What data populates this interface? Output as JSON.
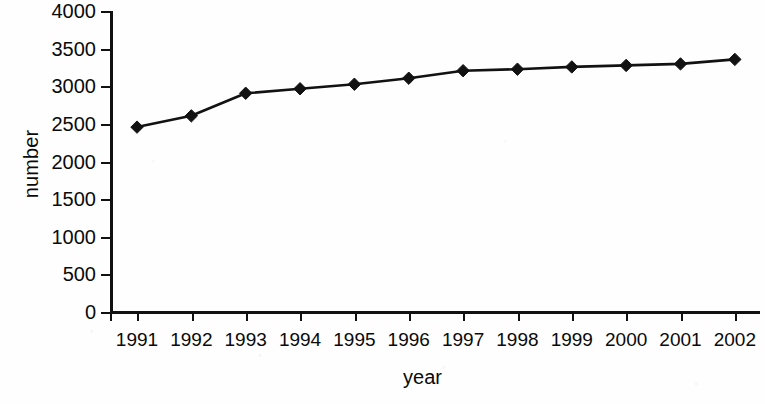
{
  "chart_data": {
    "type": "line",
    "title": "",
    "xlabel": "year",
    "ylabel": "number",
    "categories": [
      "1991",
      "1992",
      "1993",
      "1994",
      "1995",
      "1996",
      "1997",
      "1998",
      "1999",
      "2000",
      "2001",
      "2002"
    ],
    "values": [
      2470,
      2620,
      2920,
      2980,
      3040,
      3120,
      3220,
      3240,
      3270,
      3290,
      3310,
      3370
    ],
    "series": [
      {
        "name": "number",
        "values": [
          2470,
          2620,
          2920,
          2980,
          3040,
          3120,
          3220,
          3240,
          3270,
          3290,
          3310,
          3370
        ]
      }
    ],
    "ylim": [
      0,
      4000
    ],
    "yticks": [
      0,
      500,
      1000,
      1500,
      2000,
      2500,
      3000,
      3500,
      4000
    ],
    "ytick_labels": [
      "0",
      "500",
      "1000",
      "1500",
      "2000",
      "2500",
      "3000",
      "3500",
      "4000"
    ],
    "grid": false,
    "legend": "none",
    "marker": "diamond",
    "line_color": "#121212",
    "marker_color": "#121212",
    "background_color": "#ffffff"
  }
}
